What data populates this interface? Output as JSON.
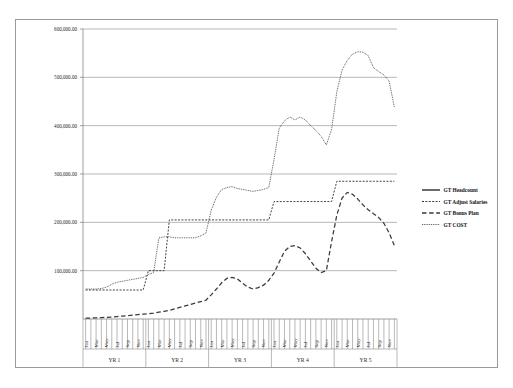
{
  "chart_data": {
    "type": "line",
    "title": "",
    "xlabel": "",
    "ylabel": "",
    "ylim": [
      0,
      600000
    ],
    "yticks": [
      100000,
      200000,
      300000,
      400000,
      500000,
      600000
    ],
    "ytick_labels": [
      "100,000.00",
      "200,000.00",
      "300,000.00",
      "400,000.00",
      "500,000.00",
      "600,000.00"
    ],
    "grid": true,
    "legend_position": "right",
    "x_groups": [
      "YR 1",
      "YR 2",
      "YR 3",
      "YR 4",
      "YR 5"
    ],
    "month_ticks_per_group": [
      "Jan",
      "Mar",
      "May",
      "Jul",
      "Sep",
      "Nov"
    ],
    "categories": [
      "YR1 Jan",
      "YR1 Feb",
      "YR1 Mar",
      "YR1 Apr",
      "YR1 May",
      "YR1 Jun",
      "YR1 Jul",
      "YR1 Aug",
      "YR1 Sep",
      "YR1 Oct",
      "YR1 Nov",
      "YR1 Dec",
      "YR2 Jan",
      "YR2 Feb",
      "YR2 Mar",
      "YR2 Apr",
      "YR2 May",
      "YR2 Jun",
      "YR2 Jul",
      "YR2 Aug",
      "YR2 Sep",
      "YR2 Oct",
      "YR2 Nov",
      "YR2 Dec",
      "YR3 Jan",
      "YR3 Feb",
      "YR3 Mar",
      "YR3 Apr",
      "YR3 May",
      "YR3 Jun",
      "YR3 Jul",
      "YR3 Aug",
      "YR3 Sep",
      "YR3 Oct",
      "YR3 Nov",
      "YR3 Dec",
      "YR4 Jan",
      "YR4 Feb",
      "YR4 Mar",
      "YR4 Apr",
      "YR4 May",
      "YR4 Jun",
      "YR4 Jul",
      "YR4 Aug",
      "YR4 Sep",
      "YR4 Oct",
      "YR4 Nov",
      "YR4 Dec",
      "YR5 Jan",
      "YR5 Feb",
      "YR5 Mar",
      "YR5 Apr",
      "YR5 May",
      "YR5 Jun",
      "YR5 Jul",
      "YR5 Aug",
      "YR5 Sep",
      "YR5 Oct",
      "YR5 Nov",
      "YR5 Dec"
    ],
    "series": [
      {
        "name": "GT Headcount",
        "style": "solid",
        "values": [
          0,
          0,
          0,
          0,
          0,
          0,
          0,
          0,
          0,
          0,
          0,
          0,
          0,
          0,
          0,
          0,
          0,
          0,
          0,
          0,
          0,
          0,
          0,
          0,
          0,
          0,
          0,
          0,
          0,
          0,
          0,
          0,
          0,
          0,
          0,
          0,
          0,
          0,
          0,
          0,
          0,
          0,
          0,
          0,
          0,
          0,
          0,
          0,
          0,
          0,
          0,
          0,
          0,
          0,
          0,
          0,
          0,
          0,
          0,
          0
        ]
      },
      {
        "name": "GT Adjust Salaries",
        "style": "dashed-fine",
        "values": [
          60000,
          60000,
          60000,
          60000,
          60000,
          60000,
          60000,
          60000,
          60000,
          60000,
          60000,
          60000,
          100000,
          100000,
          100000,
          100000,
          205000,
          205000,
          205000,
          205000,
          205000,
          205000,
          205000,
          205000,
          205000,
          205000,
          205000,
          205000,
          205000,
          205000,
          205000,
          205000,
          205000,
          205000,
          205000,
          205000,
          243000,
          243000,
          243000,
          243000,
          243000,
          243000,
          243000,
          243000,
          243000,
          243000,
          243000,
          243000,
          285000,
          285000,
          285000,
          285000,
          285000,
          285000,
          285000,
          285000,
          285000,
          285000,
          285000,
          285000
        ]
      },
      {
        "name": "GT Bonus Plan",
        "style": "dashed-long",
        "values": [
          2000,
          2000,
          2500,
          3000,
          3500,
          4000,
          5000,
          6000,
          7000,
          8000,
          9000,
          10000,
          11000,
          12000,
          14000,
          16000,
          18000,
          21000,
          24000,
          27000,
          30000,
          33000,
          36000,
          39000,
          50000,
          62000,
          75000,
          84000,
          86000,
          83000,
          74000,
          66000,
          62000,
          65000,
          70000,
          80000,
          95000,
          118000,
          140000,
          150000,
          152000,
          147000,
          135000,
          120000,
          105000,
          96000,
          100000,
          160000,
          215000,
          250000,
          262000,
          258000,
          248000,
          236000,
          226000,
          218000,
          210000,
          198000,
          178000,
          152000
        ]
      },
      {
        "name": "GT COST",
        "style": "dotted",
        "values": [
          62000,
          62000,
          62000,
          63000,
          66000,
          72000,
          76000,
          78000,
          80000,
          82000,
          84000,
          86000,
          92000,
          96000,
          168000,
          170000,
          170000,
          168000,
          168000,
          168000,
          168000,
          168000,
          172000,
          178000,
          225000,
          252000,
          268000,
          272000,
          274000,
          270000,
          268000,
          266000,
          264000,
          266000,
          268000,
          272000,
          330000,
          395000,
          410000,
          418000,
          412000,
          418000,
          412000,
          400000,
          390000,
          378000,
          360000,
          392000,
          470000,
          515000,
          535000,
          548000,
          553000,
          552000,
          545000,
          520000,
          512000,
          505000,
          492000,
          438000
        ]
      }
    ]
  },
  "legend": {
    "items": [
      {
        "label": "GT Headcount",
        "style": "solid"
      },
      {
        "label": "GT Adjust Salaries",
        "style": "dashed-fine"
      },
      {
        "label": "GT Bonus Plan",
        "style": "dashed-long"
      },
      {
        "label": "GT COST",
        "style": "dotted"
      }
    ]
  },
  "colors": {
    "line": "#3a3a3a",
    "grid": "#9a9a9a",
    "frame": "#9a9a9a",
    "text": "#1a1a1a"
  }
}
